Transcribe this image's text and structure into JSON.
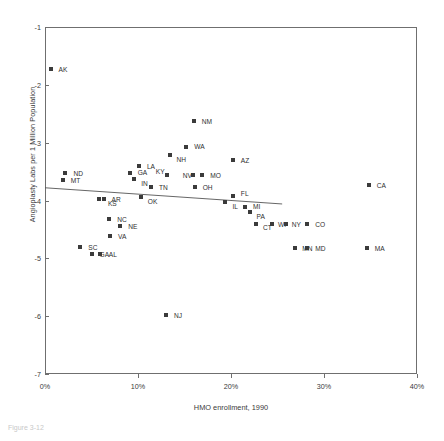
{
  "figure": {
    "caption": "Figure 3-12"
  },
  "chart_data": {
    "type": "scatter",
    "title": "",
    "xlabel": "HMO enrollment, 1990",
    "ylabel": "Angioplasty Labs per 1 Million Population",
    "xlim": [
      0,
      40
    ],
    "ylim": [
      -7,
      -1
    ],
    "grid": false,
    "legend": null,
    "xticks": [
      "0%",
      "10%",
      "20%",
      "30%",
      "40%"
    ],
    "xtick_values": [
      0,
      10,
      20,
      30,
      40
    ],
    "yticks": [
      "-1",
      "-2",
      "-3",
      "-4",
      "-5",
      "-6",
      "-7"
    ],
    "ytick_values": [
      -1,
      -2,
      -3,
      -4,
      -5,
      -6,
      -7
    ],
    "point_labels": [
      "AK",
      "NM",
      "WA",
      "NH",
      "AZ",
      "CA",
      "LA",
      "ND",
      "MT",
      "GA",
      "IN",
      "KY",
      "NV",
      "MO",
      "TN",
      "OH",
      "OK",
      "AR",
      "KS",
      "FL",
      "IL",
      "MI",
      "PA",
      "NC",
      "NE",
      "VA",
      "SC",
      "GA2",
      "AL",
      "CT",
      "WI",
      "NY",
      "CO",
      "MN",
      "MD",
      "MA",
      "NJ"
    ],
    "points": [
      {
        "label": "AK",
        "x": 0.6,
        "y": -1.72,
        "label_dx": 8,
        "label_dy": 0
      },
      {
        "label": "NM",
        "x": 16.0,
        "y": -2.62,
        "label_dx": 8,
        "label_dy": 0
      },
      {
        "label": "WA",
        "x": 15.2,
        "y": -3.08,
        "label_dx": 8,
        "label_dy": -1
      },
      {
        "label": "NH",
        "x": 13.4,
        "y": -3.22,
        "label_dx": 7,
        "label_dy": 4
      },
      {
        "label": "AZ",
        "x": 20.2,
        "y": -3.3,
        "label_dx": 8,
        "label_dy": 0
      },
      {
        "label": "CA",
        "x": 34.8,
        "y": -3.74,
        "label_dx": 8,
        "label_dy": 0
      },
      {
        "label": "LA",
        "x": 10.1,
        "y": -3.4,
        "label_dx": 8,
        "label_dy": 0
      },
      {
        "label": "ND",
        "x": 2.2,
        "y": -3.52,
        "label_dx": 8,
        "label_dy": 0
      },
      {
        "label": "MT",
        "x": 1.9,
        "y": -3.64,
        "label_dx": 8,
        "label_dy": 0
      },
      {
        "label": "GA",
        "x": 9.1,
        "y": -3.52,
        "label_dx": 8,
        "label_dy": -1
      },
      {
        "label": "IN",
        "x": 9.6,
        "y": -3.62,
        "label_dx": 7,
        "label_dy": 4
      },
      {
        "label": "KY",
        "x": 13.1,
        "y": -3.56,
        "label_dx": -11,
        "label_dy": -4
      },
      {
        "label": "NV",
        "x": 15.9,
        "y": -3.56,
        "label_dx": -10,
        "label_dy": 0
      },
      {
        "label": "MO",
        "x": 16.9,
        "y": -3.56,
        "label_dx": 8,
        "label_dy": 0
      },
      {
        "label": "TN",
        "x": 11.4,
        "y": -3.77,
        "label_dx": 8,
        "label_dy": 0
      },
      {
        "label": "OH",
        "x": 16.1,
        "y": -3.77,
        "label_dx": 8,
        "label_dy": 0
      },
      {
        "label": "OK",
        "x": 10.3,
        "y": -3.94,
        "label_dx": 7,
        "label_dy": 4
      },
      {
        "label": "AR",
        "x": 6.3,
        "y": -3.98,
        "label_dx": 8,
        "label_dy": 0
      },
      {
        "label": "KS",
        "x": 5.8,
        "y": -3.98,
        "label_dx": 9,
        "label_dy": 4
      },
      {
        "label": "FL",
        "x": 20.2,
        "y": -3.92,
        "label_dx": 8,
        "label_dy": -3
      },
      {
        "label": "IL",
        "x": 19.4,
        "y": -4.02,
        "label_dx": 7,
        "label_dy": 4
      },
      {
        "label": "MI",
        "x": 21.5,
        "y": -4.12,
        "label_dx": 8,
        "label_dy": -1
      },
      {
        "label": "PA",
        "x": 22.0,
        "y": -4.2,
        "label_dx": 7,
        "label_dy": 4
      },
      {
        "label": "NC",
        "x": 6.9,
        "y": -4.32,
        "label_dx": 8,
        "label_dy": 0
      },
      {
        "label": "NE",
        "x": 8.1,
        "y": -4.44,
        "label_dx": 8,
        "label_dy": 0
      },
      {
        "label": "VA",
        "x": 7.0,
        "y": -4.62,
        "label_dx": 8,
        "label_dy": 0
      },
      {
        "label": "SC",
        "x": 3.8,
        "y": -4.8,
        "label_dx": 8,
        "label_dy": 0
      },
      {
        "label": "GA2",
        "x": 5.0,
        "y": -4.92,
        "label_dx": 8,
        "label_dy": 0
      },
      {
        "label": "AL",
        "x": 5.9,
        "y": -4.92,
        "label_dx": 9,
        "label_dy": 0
      },
      {
        "label": "CT",
        "x": 22.7,
        "y": -4.4,
        "label_dx": 7,
        "label_dy": 3
      },
      {
        "label": "WI",
        "x": 24.4,
        "y": -4.4,
        "label_dx": 6,
        "label_dy": 0
      },
      {
        "label": "NY",
        "x": 25.9,
        "y": -4.4,
        "label_dx": 6,
        "label_dy": 0
      },
      {
        "label": "CO",
        "x": 28.2,
        "y": -4.4,
        "label_dx": 8,
        "label_dy": 0
      },
      {
        "label": "MN",
        "x": 26.9,
        "y": -4.82,
        "label_dx": 7,
        "label_dy": 0
      },
      {
        "label": "MD",
        "x": 28.2,
        "y": -4.82,
        "label_dx": 8,
        "label_dy": 0
      },
      {
        "label": "MA",
        "x": 34.6,
        "y": -4.82,
        "label_dx": 8,
        "label_dy": 0
      },
      {
        "label": "NJ",
        "x": 13.0,
        "y": -5.98,
        "label_dx": 8,
        "label_dy": 0
      }
    ],
    "trendline": {
      "x0": 0,
      "y0": -3.78,
      "x1": 25.5,
      "y1": -4.06
    }
  },
  "colors": {
    "point": "#3b3b3b",
    "frame": "#6f6f6f",
    "text": "#2e2e2e",
    "trendline": "#555555"
  }
}
